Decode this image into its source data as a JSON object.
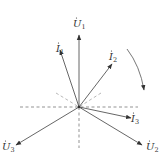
{
  "diagram": {
    "origin": [
      79,
      107
    ],
    "line_color": "#555555",
    "vectors": [
      {
        "id": "U1",
        "label": "U",
        "sub": "1",
        "tip": [
          79,
          35
        ],
        "label_pos": [
          73,
          27
        ]
      },
      {
        "id": "I1",
        "label": "I",
        "sub": "1",
        "tip": [
          60,
          50
        ],
        "label_pos": [
          56,
          45
        ]
      },
      {
        "id": "I2",
        "label": "I",
        "sub": "2",
        "tip": [
          112,
          64
        ],
        "label_pos": [
          109,
          60
        ]
      },
      {
        "id": "I3",
        "label": "I",
        "sub": "3",
        "tip": [
          131,
          118
        ],
        "label_pos": [
          132,
          125
        ]
      },
      {
        "id": "U2",
        "label": "U",
        "sub": "2",
        "tip": [
          142,
          145
        ],
        "label_pos": [
          146,
          150
        ]
      },
      {
        "id": "U3",
        "label": "U",
        "sub": "3",
        "tip": [
          16,
          145
        ],
        "label_pos": [
          2,
          150
        ]
      }
    ],
    "rotation_indicator": "clockwise"
  }
}
